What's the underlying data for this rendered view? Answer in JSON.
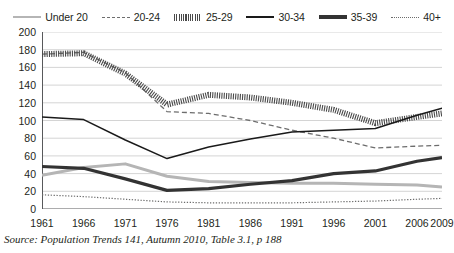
{
  "chart_data": {
    "type": "line",
    "title": "",
    "xlabel": "",
    "ylabel": "",
    "x": [
      1961,
      1966,
      1971,
      1976,
      1981,
      1986,
      1991,
      1996,
      2001,
      2006,
      2009
    ],
    "xlim": [
      1961,
      2009
    ],
    "ylim": [
      0,
      200
    ],
    "ytick_step": 20,
    "grid": true,
    "legend_position": "top",
    "xtick_labels": [
      "1961",
      "1966",
      "1971",
      "1976",
      "1981",
      "1986",
      "1991",
      "1996",
      "2001",
      "2006",
      "2009"
    ],
    "ytick_labels": [
      "0",
      "20",
      "40",
      "60",
      "80",
      "100",
      "120",
      "140",
      "160",
      "180",
      "200"
    ],
    "series": [
      {
        "name": "Under 20",
        "color": "#b5b5b5",
        "style": "solid-thick",
        "values": [
          38,
          47,
          51,
          37,
          31,
          30,
          29,
          29,
          28,
          27,
          25
        ]
      },
      {
        "name": "20-24",
        "color": "#6d6d6d",
        "style": "dashed",
        "values": [
          175,
          177,
          154,
          110,
          108,
          100,
          89,
          80,
          69,
          71,
          72
        ]
      },
      {
        "name": "25-29",
        "color": "#4a4a4a",
        "style": "dotted-dense",
        "values": [
          175,
          176,
          153,
          118,
          129,
          126,
          120,
          112,
          97,
          104,
          108
        ]
      },
      {
        "name": "30-34",
        "color": "#1a1a1a",
        "style": "solid-thin",
        "values": [
          104,
          101,
          78,
          57,
          70,
          79,
          87,
          89,
          91,
          106,
          114
        ]
      },
      {
        "name": "35-39",
        "color": "#333333",
        "style": "solid-bold",
        "values": [
          48,
          46,
          34,
          21,
          23,
          28,
          32,
          40,
          43,
          54,
          58
        ]
      },
      {
        "name": "40+",
        "color": "#6d6d6d",
        "style": "dotted-fine",
        "values": [
          16,
          14,
          11,
          8,
          7,
          7,
          7,
          8,
          9,
          11,
          12
        ]
      }
    ]
  },
  "legend": {
    "items": [
      {
        "label": "Under 20",
        "swatch": "line-swatch-under-20"
      },
      {
        "label": "20-24",
        "swatch": "line-swatch-20-24"
      },
      {
        "label": "25-29",
        "swatch": "line-swatch-25-29"
      },
      {
        "label": "30-34",
        "swatch": "line-swatch-30-34"
      },
      {
        "label": "35-39",
        "swatch": "line-swatch-35-39"
      },
      {
        "label": "40+",
        "swatch": "line-swatch-40-plus"
      }
    ]
  },
  "source": {
    "text": "Source: Population Trends 141, Autumn 2010, Table 3.1, p 188"
  },
  "colors": {
    "axis": "#58595b",
    "grid": "#c9c9c9",
    "text": "#231f20",
    "background": "#ffffff"
  }
}
